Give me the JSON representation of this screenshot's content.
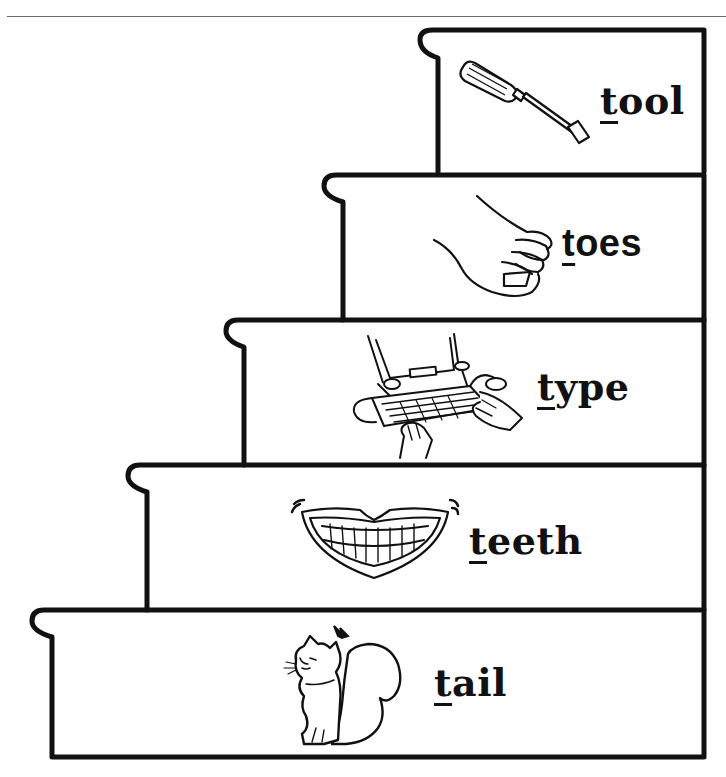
{
  "worksheet": {
    "theme": "initial t sound staircase",
    "steps": [
      {
        "word": "tool",
        "first_letter": "t",
        "rest": "ool",
        "picture": "screwdriver-icon",
        "order_from_top": 1
      },
      {
        "word": "toes",
        "first_letter": "t",
        "rest": "oes",
        "picture": "foot-toes-icon",
        "order_from_top": 2
      },
      {
        "word": "type",
        "first_letter": "t",
        "rest": "ype",
        "picture": "typing-computer-icon",
        "order_from_top": 3
      },
      {
        "word": "teeth",
        "first_letter": "t",
        "rest": "eeth",
        "picture": "smiling-teeth-icon",
        "order_from_top": 4
      },
      {
        "word": "tail",
        "first_letter": "t",
        "rest": "ail",
        "picture": "squirrel-tail-icon",
        "order_from_top": 5
      }
    ],
    "colors": {
      "ink": "#111111",
      "paper": "#ffffff",
      "rule": "#6a6a6a"
    }
  }
}
